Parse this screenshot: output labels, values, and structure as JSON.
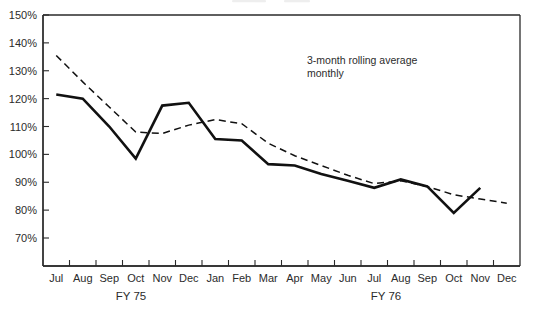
{
  "chart_data": {
    "type": "line",
    "title": "",
    "subtitle": "",
    "xlabel": "",
    "ylabel": "",
    "ylim": [
      60,
      150
    ],
    "yticks": [
      150,
      140,
      130,
      120,
      110,
      100,
      90,
      80,
      70
    ],
    "ytick_labels": [
      "150%",
      "140%",
      "130%",
      "120%",
      "110%",
      "100%",
      "90%",
      "80%",
      "70%"
    ],
    "grid": false,
    "legend_position": "inside-top-right",
    "categories": [
      "Jul",
      "Aug",
      "Sep",
      "Oct",
      "Nov",
      "Dec",
      "Jan",
      "Feb",
      "Mar",
      "Apr",
      "May",
      "Jun",
      "Jul",
      "Aug",
      "Sep",
      "Oct",
      "Nov",
      "Dec"
    ],
    "x_group_labels": [
      {
        "label": "FY 75",
        "start": "Jul",
        "end": "Dec"
      },
      {
        "label": "FY 76",
        "start": "Jan",
        "end": "Dec"
      }
    ],
    "annotations": [
      {
        "text": "3-month rolling average",
        "style": "dashed"
      },
      {
        "text": "monthly",
        "style": "solid"
      }
    ],
    "series": [
      {
        "name": "monthly",
        "style": "solid",
        "values": [
          121.5,
          120.0,
          110.0,
          98.5,
          117.5,
          118.5,
          105.5,
          105.0,
          96.5,
          96.0,
          93.0,
          90.5,
          88.0,
          91.0,
          88.5,
          79.0,
          88.0,
          null
        ]
      },
      {
        "name": "3-month rolling average",
        "style": "dashed",
        "values": [
          135.5,
          126.0,
          117.0,
          108.0,
          107.5,
          110.5,
          112.5,
          111.0,
          104.0,
          99.5,
          96.0,
          92.5,
          89.5,
          90.5,
          88.5,
          85.5,
          84.0,
          82.5
        ]
      }
    ]
  },
  "axis": {
    "y_tick_labels": [
      "150%",
      "140%",
      "130%",
      "120%",
      "110%",
      "100%",
      "90%",
      "80%",
      "70%"
    ],
    "x_tick_labels": [
      "Jul",
      "Aug",
      "Sep",
      "Oct",
      "Nov",
      "Dec",
      "Jan",
      "Feb",
      "Mar",
      "Apr",
      "May",
      "Jun",
      "Jul",
      "Aug",
      "Sep",
      "Oct",
      "Nov",
      "Dec"
    ]
  },
  "fiscal": {
    "fy75": "FY 75",
    "fy76": "FY 76"
  },
  "annotation": {
    "line1": "3-month rolling average",
    "line2": "monthly"
  },
  "colors": {
    "line": "#111111",
    "axis": "#2b2b2b",
    "background": "#ffffff"
  }
}
